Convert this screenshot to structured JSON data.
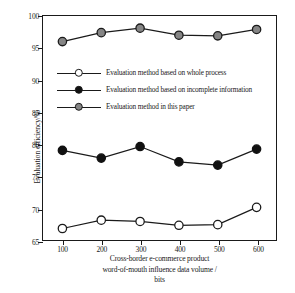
{
  "chart_data": {
    "type": "line",
    "title": "",
    "xlabel": "Cross-border e-commerce product word-of-mouth influence data volume / bits",
    "xlabel_lines": [
      "Cross-border e-commerce product",
      "word-of-mouth influence data volume /",
      "bits"
    ],
    "ylabel": "Evaluation efficiency/%",
    "x": [
      100,
      200,
      300,
      400,
      500,
      600
    ],
    "xtick_labels": [
      "100",
      "200",
      "300",
      "400",
      "500",
      "600"
    ],
    "ytick_labels": [
      "65",
      "70",
      "75",
      "80",
      "85",
      "90",
      "95",
      "100"
    ],
    "yticks": [
      65,
      70,
      75,
      80,
      85,
      90,
      95,
      100
    ],
    "xlim": [
      50,
      650
    ],
    "ylim": [
      65,
      100
    ],
    "grid": false,
    "legend_position": "upper-left-inside",
    "series": [
      {
        "name": "Evaluation method based on whole process",
        "marker": "open-circle",
        "marker_fill": "#ffffff",
        "marker_edge": "#1a1a1a",
        "line_color": "#1a1a1a",
        "values": [
          66.8,
          68.1,
          67.9,
          67.3,
          67.4,
          70.1
        ]
      },
      {
        "name": "Evaluation method based on incomplete information",
        "marker": "filled-circle",
        "marker_fill": "#111111",
        "marker_edge": "#111111",
        "line_color": "#1a1a1a",
        "values": [
          79.0,
          77.8,
          79.6,
          77.2,
          76.7,
          79.2
        ]
      },
      {
        "name": "Evaluation method in this paper",
        "marker": "gray-circle",
        "marker_fill": "#858585",
        "marker_edge": "#1a1a1a",
        "line_color": "#1a1a1a",
        "values": [
          96.0,
          97.4,
          98.1,
          97.0,
          96.9,
          97.9
        ]
      }
    ]
  },
  "legend": {
    "items": [
      {
        "label": "Evaluation method based on whole process"
      },
      {
        "label": "Evaluation method based on incomplete information"
      },
      {
        "label": "Evaluation method in this paper"
      }
    ]
  },
  "axes": {
    "y_title": "Evaluation efficiency/%",
    "x_title_line1": "Cross-border e-commerce product",
    "x_title_line2": "word-of-mouth influence data volume /",
    "x_title_line3": "bits"
  }
}
